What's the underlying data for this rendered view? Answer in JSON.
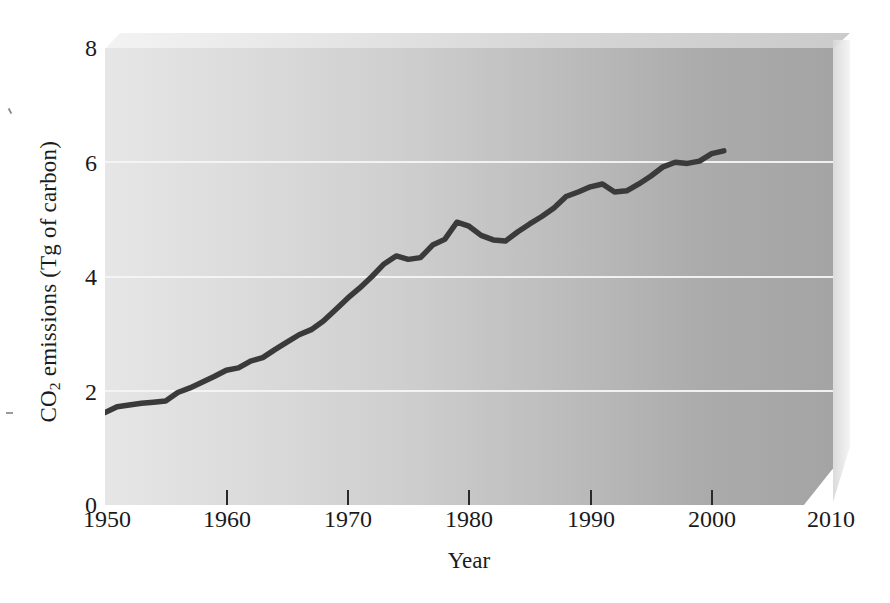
{
  "chart_data": {
    "type": "line",
    "title": "",
    "xlabel": "Year",
    "ylabel": "CO2 emissions (Tg of carbon)",
    "ylabel_parts": {
      "prefix": "CO",
      "sub": "2",
      "suffix": " emissions (Tg of carbon)"
    },
    "xlim": [
      1950,
      2010
    ],
    "ylim": [
      0,
      8
    ],
    "xticks": [
      1950,
      1960,
      1970,
      1980,
      1990,
      2000,
      2010
    ],
    "xtick_labels": [
      "1950",
      "1960",
      "1970",
      "1980",
      "1990",
      "2000",
      "2010"
    ],
    "yticks": [
      0,
      2,
      4,
      6,
      8
    ],
    "ytick_labels": [
      "0",
      "2",
      "4",
      "6",
      "8"
    ],
    "gridlines_y": [
      2,
      4,
      6
    ],
    "grid": "horizontal-only",
    "legend": "none",
    "line_color": "#3a3a3a",
    "line_width": 5,
    "series": [
      {
        "name": "CO2 emissions",
        "x": [
          1950,
          1951,
          1952,
          1953,
          1954,
          1955,
          1956,
          1957,
          1958,
          1959,
          1960,
          1961,
          1962,
          1963,
          1964,
          1965,
          1966,
          1967,
          1968,
          1969,
          1970,
          1971,
          1972,
          1973,
          1974,
          1975,
          1976,
          1977,
          1978,
          1979,
          1980,
          1981,
          1982,
          1983,
          1984,
          1985,
          1986,
          1987,
          1988,
          1989,
          1990,
          1991,
          1992,
          1993,
          1994,
          1995,
          1996,
          1997,
          1998,
          1999,
          2000,
          2001
        ],
        "y": [
          1.62,
          1.72,
          1.75,
          1.78,
          1.8,
          1.82,
          1.97,
          2.05,
          2.15,
          2.25,
          2.36,
          2.4,
          2.52,
          2.58,
          2.72,
          2.85,
          2.98,
          3.07,
          3.22,
          3.42,
          3.62,
          3.8,
          4.0,
          4.22,
          4.36,
          4.3,
          4.33,
          4.55,
          4.65,
          4.95,
          4.88,
          4.72,
          4.64,
          4.62,
          4.78,
          4.92,
          5.05,
          5.2,
          5.4,
          5.48,
          5.57,
          5.62,
          5.48,
          5.5,
          5.62,
          5.76,
          5.92,
          6.0,
          5.98,
          6.02,
          6.15,
          6.2
        ]
      }
    ]
  },
  "axis": {
    "y_title": "CO2 emissions (Tg of carbon)",
    "x_title": "Year"
  }
}
